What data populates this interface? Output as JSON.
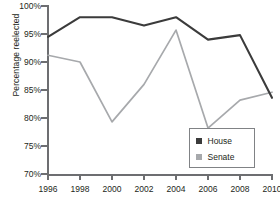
{
  "chart_data": {
    "type": "line",
    "title": "",
    "xlabel": "",
    "ylabel": "Percentage reelected",
    "x": [
      1996,
      1998,
      2000,
      2002,
      2004,
      2006,
      2008,
      2010
    ],
    "categories": [
      "1996",
      "1998",
      "2000",
      "2002",
      "2004",
      "2006",
      "2008",
      "2010"
    ],
    "xlim": [
      1996,
      2010
    ],
    "ylim": [
      70,
      100
    ],
    "ytick_labels": [
      "70%",
      "75%",
      "80%",
      "85%",
      "90%",
      "95%",
      "100%"
    ],
    "ytick_values": [
      70,
      75,
      80,
      85,
      90,
      95,
      100
    ],
    "grid": false,
    "legend_position": "bottom-right",
    "series": [
      {
        "name": "House",
        "color": "#3b3b3b",
        "values": [
          94.5,
          98.0,
          98.0,
          96.5,
          98.0,
          94.0,
          94.8,
          83.6
        ]
      },
      {
        "name": "Senate",
        "color": "#a7a9ac",
        "values": [
          91.2,
          90.0,
          79.3,
          86.0,
          95.7,
          78.2,
          83.2,
          84.6
        ]
      }
    ]
  },
  "legend": {
    "items": [
      {
        "label": "House",
        "swatch": "house-swatch"
      },
      {
        "label": "Senate",
        "swatch": "senate-swatch"
      }
    ]
  }
}
